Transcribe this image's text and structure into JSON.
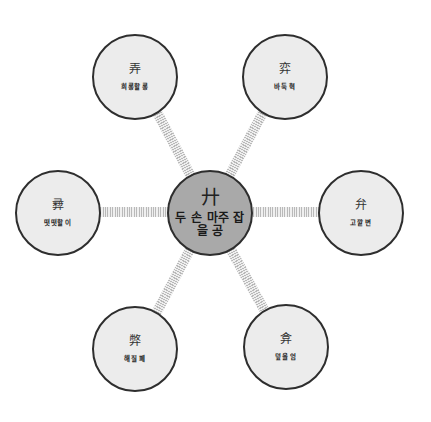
{
  "colors": {
    "outer_fill": "#ececec",
    "center_fill": "#a9a9a9",
    "border": "#2e2e2e",
    "connector": "#b9b9b9"
  },
  "center": {
    "hanja": "廾",
    "meaning": "두 손 마주 잡을 공"
  },
  "nodes": [
    {
      "position": "top-left",
      "hanja": "弄",
      "meaning": "희롱할 롱"
    },
    {
      "position": "top-right",
      "hanja": "弈",
      "meaning": "바둑 혁"
    },
    {
      "position": "left",
      "hanja": "彛",
      "meaning": "떳떳할 이"
    },
    {
      "position": "right",
      "hanja": "弁",
      "meaning": "고깔 변"
    },
    {
      "position": "bottom-left",
      "hanja": "弊",
      "meaning": "해질 폐"
    },
    {
      "position": "bottom-right",
      "hanja": "弇",
      "meaning": "덮을 엄"
    }
  ]
}
